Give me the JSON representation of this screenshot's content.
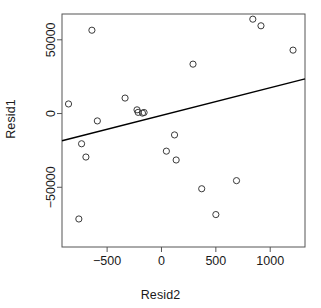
{
  "chart_data": {
    "type": "scatter",
    "title": "",
    "xlabel": "Resid2",
    "ylabel": "Resid1",
    "xlim": [
      -915,
      1320
    ],
    "ylim": [
      -90500,
      67500
    ],
    "xticks": [
      -500,
      0,
      500,
      1000
    ],
    "xticklabels": [
      "-500",
      "0",
      "500",
      "1000"
    ],
    "yticks": [
      -50000,
      0,
      50000
    ],
    "yticklabels": [
      "-50000",
      "0",
      "50000"
    ],
    "grid": false,
    "legend": null,
    "marker": "open-circle",
    "marker_color": "#3a3a3a",
    "points": [
      {
        "x": -855,
        "y": 6500
      },
      {
        "x": -760,
        "y": -71500
      },
      {
        "x": -735,
        "y": -20500
      },
      {
        "x": -695,
        "y": -29500
      },
      {
        "x": -640,
        "y": 56500
      },
      {
        "x": -590,
        "y": -5000
      },
      {
        "x": -335,
        "y": 10500
      },
      {
        "x": -225,
        "y": 2500
      },
      {
        "x": -215,
        "y": 800
      },
      {
        "x": -175,
        "y": 300
      },
      {
        "x": -160,
        "y": 700
      },
      {
        "x": 45,
        "y": -25500
      },
      {
        "x": 120,
        "y": -14500
      },
      {
        "x": 135,
        "y": -31500
      },
      {
        "x": 290,
        "y": 33500
      },
      {
        "x": 370,
        "y": -51000
      },
      {
        "x": 500,
        "y": -68500
      },
      {
        "x": 690,
        "y": -45500
      },
      {
        "x": 840,
        "y": 64000
      },
      {
        "x": 915,
        "y": 59500
      },
      {
        "x": 1210,
        "y": 43000
      }
    ],
    "trendline": {
      "type": "linear-fit",
      "color": "#000000",
      "x_start": -915,
      "y_start": -18500,
      "x_end": 1320,
      "y_end": 23500
    }
  },
  "plot_box": {
    "left": 62,
    "top": 14,
    "right": 305,
    "bottom": 247,
    "border_color": "#555555"
  }
}
